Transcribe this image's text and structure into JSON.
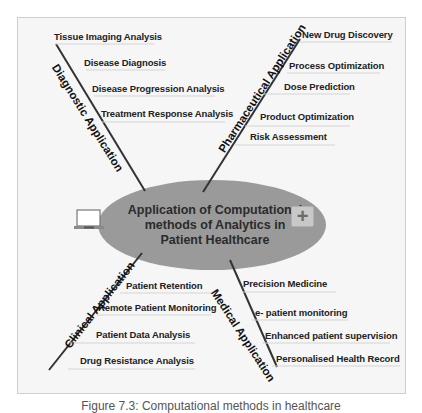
{
  "center": {
    "lines": [
      "Application of Computational",
      "methods of Analytics in",
      "Patient Healthcare"
    ],
    "fill": "#9a9a9a",
    "icons": [
      "laptop-icon",
      "plus-icon"
    ]
  },
  "branches": {
    "diagnostic": {
      "label": "Diagnostic Application",
      "items": [
        "Tissue Imaging Analysis",
        "Disease Diagnosis",
        "Disease Progression Analysis",
        "Treatment  Response Analysis"
      ]
    },
    "pharmaceutical": {
      "label": "Pharmaceutical Application",
      "items": [
        "New Drug Discovery",
        "Process Optimization",
        "Dose Prediction",
        "Product Optimization",
        "Risk Assessment"
      ]
    },
    "clinical": {
      "label": "Clinical Application",
      "items": [
        "Patient Retention",
        "Remote Patient Monitoring",
        "Patient Data Analysis",
        "Drug Resistance Analysis"
      ]
    },
    "medical": {
      "label": "Medical Application",
      "items": [
        "Precision Medicine",
        "e- patient monitoring",
        "Enhanced patient supervision",
        "Personalised Health Record"
      ]
    }
  },
  "caption": "Figure 7.3: Computational methods in healthcare"
}
